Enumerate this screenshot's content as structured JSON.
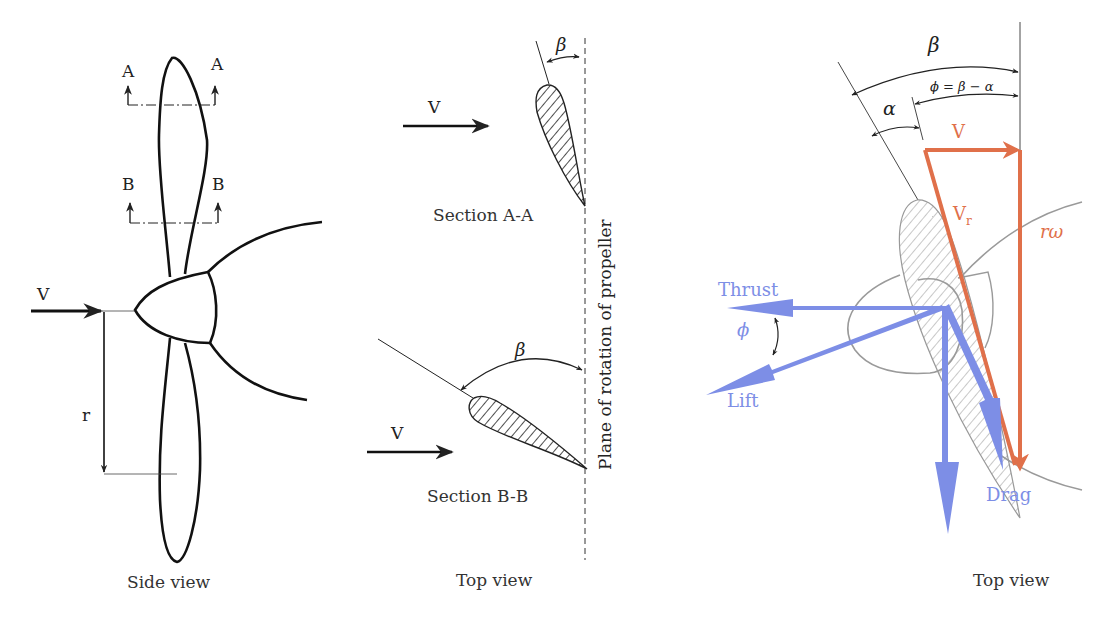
{
  "figure": {
    "panels": [
      {
        "id": "side_view",
        "caption": "Side view",
        "labels": {
          "section_a_left": "A",
          "section_a_right": "A",
          "section_b_left": "B",
          "section_b_right": "B",
          "velocity": "V",
          "radius": "r"
        }
      },
      {
        "id": "top_view_sections",
        "caption": "Top view",
        "labels": {
          "velocity_a": "V",
          "velocity_b": "V",
          "beta_a": "β",
          "beta_b": "β",
          "section_a": "Section A-A",
          "section_b": "Section B-B",
          "plane_of_rotation": "Plane of rotation of propeller"
        }
      },
      {
        "id": "top_view_forces",
        "caption": "Top view",
        "labels": {
          "beta": "β",
          "alpha": "α",
          "phi_equation": "ϕ = β − α",
          "velocity": "V",
          "relative_velocity": "V",
          "relative_velocity_sub": "r",
          "rotational_velocity": "rω",
          "thrust": "Thrust",
          "lift": "Lift",
          "drag": "Drag",
          "phi": "ϕ"
        },
        "colors": {
          "velocity_vectors": "#e0704a",
          "force_vectors": "#7d8ee6",
          "outline_gray": "#9a9a9a"
        }
      }
    ]
  }
}
